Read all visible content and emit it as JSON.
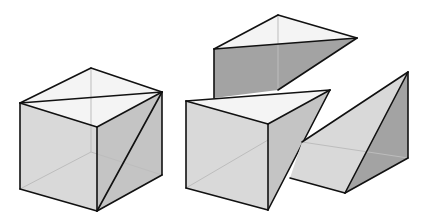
{
  "figure": {
    "colors": {
      "background": "#ffffff",
      "top_face": "#f4f4f4",
      "light_face": "#d9d9d9",
      "mid_face": "#c4c4c4",
      "dark_face": "#a3a3a3",
      "edge": "#111111",
      "hidden_edge": "#bdbdbd"
    },
    "shapes": [
      {
        "name": "whole-cube",
        "label": "Complete cube with diagonal cut lines",
        "faces": [
          {
            "role": "top",
            "fill": "top_face",
            "points": "20,103 91,68 162,92 97,127"
          },
          {
            "role": "front-left",
            "fill": "light_face",
            "points": "20,103 97,127 97,211 20,189"
          },
          {
            "role": "front-right",
            "fill": "mid_face",
            "points": "97,127 162,92 162,175 97,211"
          }
        ],
        "hidden_edges": [
          "91,68 91,152",
          "91,152 20,189",
          "91,152 162,175"
        ],
        "edges": [
          "20,103 91,68",
          "91,68 162,92",
          "162,92 97,127",
          "97,127 20,103",
          "20,103 162,92",
          "20,103 20,189",
          "20,189 97,211",
          "97,211 97,127",
          "97,211 162,175",
          "162,175 162,92",
          "162,92 97,211"
        ]
      },
      {
        "name": "top-pyramid-piece",
        "label": "Upper piece (dark triangular prism-like wedge)",
        "faces": [
          {
            "role": "top",
            "fill": "top_face",
            "points": "214,49 278,15 357,38"
          },
          {
            "role": "side",
            "fill": "dark_face",
            "points": "214,49 357,38 278,90 214,98"
          }
        ],
        "hidden_edges": [
          "278,15 278,90"
        ],
        "edges": [
          "214,49 278,15",
          "278,15 357,38",
          "357,38 214,49",
          "214,49 214,98",
          "357,38 278,90"
        ]
      },
      {
        "name": "front-pyramid-piece",
        "label": "Front-left piece (cube with diagonal face)",
        "faces": [
          {
            "role": "top",
            "fill": "top_face",
            "points": "186,101 330,90 268,124"
          },
          {
            "role": "front-left",
            "fill": "light_face",
            "points": "186,101 268,124 268,210 186,188"
          },
          {
            "role": "front-right",
            "fill": "mid_face",
            "points": "268,124 330,90 268,210"
          }
        ],
        "hidden_edges": [
          "186,188 268,140"
        ],
        "edges": [
          "186,101 330,90",
          "330,90 268,124",
          "268,124 186,101",
          "186,101 186,188",
          "186,188 268,210",
          "268,210 268,124",
          "268,210 330,90"
        ]
      },
      {
        "name": "right-pyramid-piece",
        "label": "Right piece (tetrahedral wedge)",
        "faces": [
          {
            "role": "slanted",
            "fill": "light_face",
            "points": "302,142 408,72 345,193 290,178"
          },
          {
            "role": "side",
            "fill": "dark_face",
            "points": "408,72 408,158 345,193"
          }
        ],
        "hidden_edges": [
          "302,142 408,158"
        ],
        "edges": [
          "302,142 408,72",
          "408,72 345,193",
          "345,193 290,178",
          "408,72 408,158",
          "408,158 345,193"
        ]
      }
    ]
  }
}
